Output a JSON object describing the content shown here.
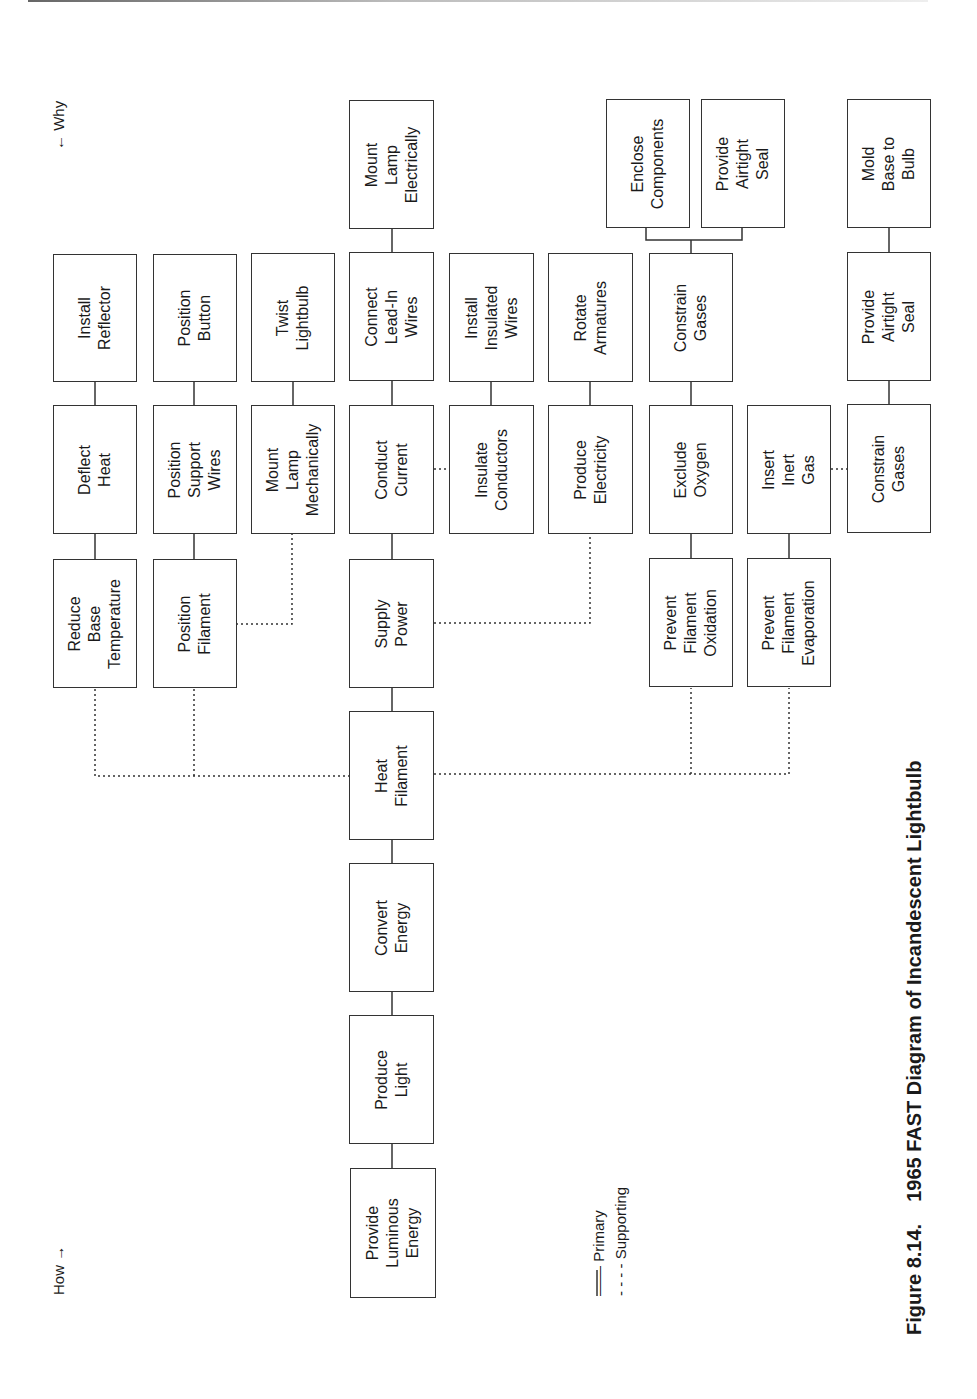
{
  "figure": {
    "caption_number": "Figure 8.14.",
    "caption_title": "1965 FAST Diagram of Incandescent Lightbulb"
  },
  "direction_labels": {
    "why": "← Why",
    "how": "How →"
  },
  "legend": {
    "primary": "—— Primary",
    "supporting": "- - - - Supporting"
  },
  "colors": {
    "line": "#333333",
    "background": "#ffffff"
  },
  "nodes": {
    "provide_luminous_energy": "Provide\nLuminous\nEnergy",
    "produce_light": "Produce\nLight",
    "convert_energy": "Convert\nEnergy",
    "heat_filament": "Heat\nFilament",
    "reduce_base_temperature": "Reduce\nBase\nTemperature",
    "deflect_heat": "Deflect\nHeat",
    "install_reflector": "Install\nReflector",
    "position_filament": "Position\nFilament",
    "position_support_wires": "Position\nSupport\nWires",
    "position_button": "Position\nButton",
    "mount_lamp_mechanically": "Mount\nLamp\nMechanically",
    "twist_lightbulb": "Twist\nLightbulb",
    "supply_power": "Supply\nPower",
    "conduct_current": "Conduct\nCurrent",
    "connect_lead_in_wires": "Connect\nLead-In\nWires",
    "mount_lamp_electrically": "Mount\nLamp\nElectrically",
    "insulate_conductors": "Insulate\nConductors",
    "install_insulated_wires": "Install\nInsulated\nWires",
    "produce_electricity": "Produce\nElectricity",
    "rotate_armatures": "Rotate\nArmatures",
    "prevent_filament_oxidation": "Prevent\nFilament\nOxidation",
    "exclude_oxygen": "Exclude\nOxygen",
    "constrain_gases_1": "Constrain\nGases",
    "enclose_components": "Enclose\nComponents",
    "provide_airtight_seal_1": "Provide\nAirtight\nSeal",
    "prevent_filament_evaporation": "Prevent\nFilament\nEvaporation",
    "insert_inert_gas": "Insert\nInert\nGas",
    "constrain_gases_2": "Constrain\nGases",
    "provide_airtight_seal_2": "Provide\nAirtight\nSeal",
    "mold_base_to_bulb": "Mold\nBase to\nBulb"
  }
}
